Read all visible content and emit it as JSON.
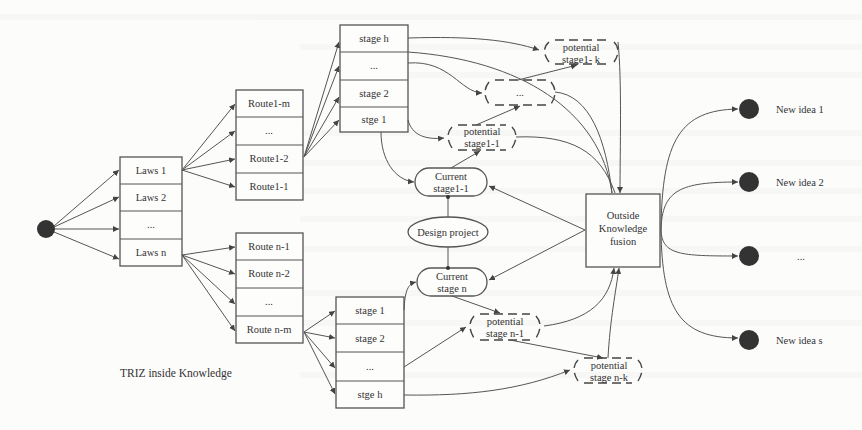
{
  "diagram": {
    "caption": "TRIZ inside Knowledge",
    "start_node": {
      "shape": "filled-circle"
    },
    "laws": [
      "Laws 1",
      "Laws 2",
      "...",
      "Laws n"
    ],
    "routes_1": [
      "Route1-m",
      "...",
      "Route1-2",
      "Route1-1"
    ],
    "routes_n": [
      "Route n-1",
      "Route n-2",
      "...",
      "Route n-m"
    ],
    "stages_top": [
      "stage h",
      "...",
      "stage 2",
      "stge 1"
    ],
    "stages_bottom": [
      "stage 1",
      "stage 2",
      "...",
      "stge h"
    ],
    "potential_top_k": [
      "potential",
      "stage1- k"
    ],
    "potential_top_mid": "...",
    "potential_top_1": [
      "potential",
      "stage1-1"
    ],
    "current_top": [
      "Current",
      "stage1-1"
    ],
    "design_project": "Design project",
    "current_bottom": [
      "Current",
      "stage n"
    ],
    "potential_bottom_1": [
      "potential",
      "stage n-1"
    ],
    "potential_bottom_k": [
      "potential",
      "stage n-k"
    ],
    "fusion": [
      "Outside",
      "Knowledge",
      "fusion"
    ],
    "ideas": [
      "New idea 1",
      "New idea 2",
      "...",
      "New idea s"
    ]
  }
}
